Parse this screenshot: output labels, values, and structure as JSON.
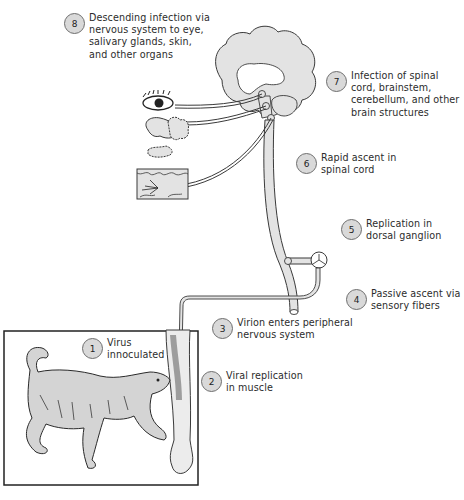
{
  "colors": {
    "tissue_fill": "#e3e3e3",
    "outline": "#3a3a3a",
    "badge_fill": "#d9d9d9",
    "text": "#2c2c2c"
  },
  "steps": [
    {
      "number": "1",
      "text": "Virus\ninnoculated"
    },
    {
      "number": "2",
      "text": "Viral replication\nin muscle"
    },
    {
      "number": "3",
      "text": "Virion enters peripheral\nnervous system"
    },
    {
      "number": "4",
      "text": "Passive ascent via\nsensory fibers"
    },
    {
      "number": "5",
      "text": "Replication in\ndorsal ganglion"
    },
    {
      "number": "6",
      "text": "Rapid ascent in\nspinal cord"
    },
    {
      "number": "7",
      "text": "Infection of spinal\ncord, brainstem,\ncerebellum, and other\nbrain structures"
    },
    {
      "number": "8",
      "text": "Descending infection via\nnervous system to eye,\nsalivary glands, skin,\nand other organs"
    }
  ],
  "illustrations": {
    "brain": "brain",
    "spinal_cord": "spinal-cord",
    "eye": "eye",
    "salivary_gland": "salivary-gland",
    "skin": "skin-section",
    "dorsal_ganglion": "dorsal-ganglion",
    "dog": "rabid-dog",
    "leg": "bitten-leg"
  }
}
